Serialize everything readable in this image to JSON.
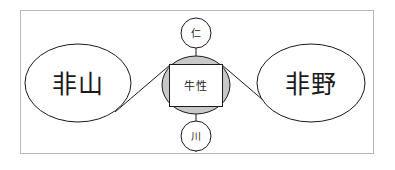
{
  "figure": {
    "background_color": "#ffffff",
    "frame_border_color": "#b8b8b8",
    "outline_color": "#1a1a1a",
    "center_fill_color": "#c8c8c8",
    "node_fill_color": "#ffffff"
  },
  "nodes": {
    "left": {
      "label": "非山",
      "shape": "ellipse"
    },
    "right": {
      "label": "非野",
      "shape": "ellipse"
    },
    "center": {
      "label": "牛性",
      "shape": "rectangle-over-ellipse"
    },
    "top": {
      "label": "仁",
      "shape": "circle"
    },
    "bottom": {
      "label": "川",
      "shape": "circle"
    }
  },
  "edges": [
    {
      "from": "center",
      "to": "left",
      "style": "diagonal"
    },
    {
      "from": "center",
      "to": "right",
      "style": "diagonal"
    },
    {
      "from": "top",
      "to": "center",
      "style": "vertical"
    },
    {
      "from": "center",
      "to": "bottom",
      "style": "vertical"
    }
  ]
}
